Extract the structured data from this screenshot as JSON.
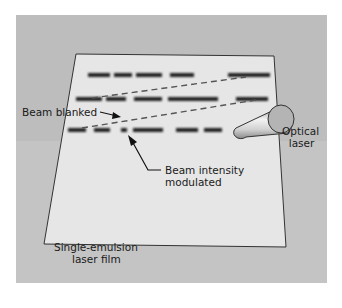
{
  "diagram": {
    "title": "",
    "background_color": "#c0c0c0",
    "film_color": "#e8e8e8",
    "labels": {
      "beam_blanked": "Beam blanked",
      "optical_laser_line1": "Optical",
      "optical_laser_line2": "laser",
      "beam_intensity_line1": "Beam intensity",
      "beam_intensity_line2": "modulated",
      "film_line1": "Single-emulsion",
      "film_line2": "laser film"
    },
    "elements": [
      {
        "id": "film",
        "type": "sheet",
        "label": "Single-emulsion laser film"
      },
      {
        "id": "laser",
        "type": "cylinder",
        "label": "Optical laser"
      },
      {
        "id": "scan-lines",
        "type": "raster-lines",
        "count": 3
      },
      {
        "id": "retrace-1",
        "type": "dashed-line",
        "meaning": "beam blanked retrace"
      },
      {
        "id": "retrace-2",
        "type": "dashed-line",
        "meaning": "beam blanked retrace"
      }
    ],
    "annotations": [
      {
        "text": "Beam blanked",
        "points_to": "retrace-2"
      },
      {
        "text": "Beam intensity modulated",
        "points_to": "scan-lines"
      }
    ]
  }
}
